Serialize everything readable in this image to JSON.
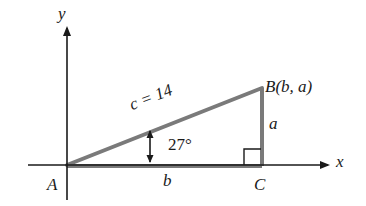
{
  "diagram": {
    "type": "right-triangle-on-coordinate-axes",
    "colors": {
      "axis": "#1a1a1a",
      "triangle": "#7a7a7a",
      "text": "#1a1a1a",
      "background": "#ffffff"
    },
    "axes": {
      "x_label": "x",
      "y_label": "y"
    },
    "vertices": {
      "A": {
        "label": "A"
      },
      "B": {
        "label_prefix": "B",
        "label_coords": "(b, a)",
        "full_label": "B(b, a)"
      },
      "C": {
        "label": "C"
      }
    },
    "sides": {
      "hypotenuse": {
        "label": "c = 14",
        "name": "c",
        "value": "14"
      },
      "vertical_leg": {
        "label": "a"
      },
      "horizontal_leg": {
        "label": "b"
      }
    },
    "angle": {
      "label": "27°",
      "value_degrees": 27,
      "at_vertex": "A"
    },
    "right_angle_marker_at": "C"
  }
}
